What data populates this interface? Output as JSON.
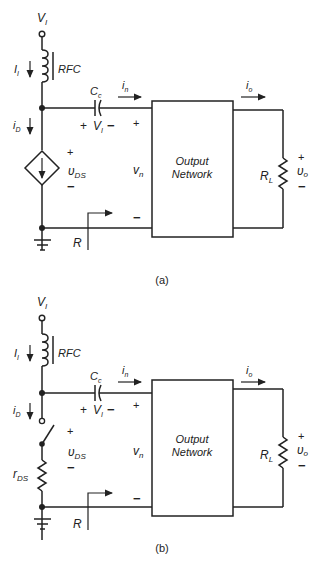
{
  "figure": {
    "panels": [
      {
        "id": "a",
        "caption": "(a)",
        "labels": {
          "supply": "V",
          "supply_sub": "I",
          "supply_current": "I",
          "supply_current_sub": "I",
          "choke": "RFC",
          "coupling_cap": "C",
          "coupling_cap_sub": "c",
          "input_current": "i",
          "input_current_sub": "n",
          "drain_current": "i",
          "drain_current_sub": "D",
          "cap_voltage_plus": "+",
          "cap_voltage": "V",
          "cap_voltage_sub": "I",
          "cap_voltage_minus": "−",
          "device_voltage_plus": "+",
          "device_voltage": "υ",
          "device_voltage_sub": "DS",
          "device_voltage_minus": "−",
          "input_voltage_plus": "+",
          "input_voltage": "v",
          "input_voltage_sub": "n",
          "input_voltage_minus": "−",
          "input_resistance": "R",
          "network_line1": "Output",
          "network_line2": "Network",
          "output_current": "i",
          "output_current_sub": "o",
          "load": "R",
          "load_sub": "L",
          "output_voltage_plus": "+",
          "output_voltage": "υ",
          "output_voltage_sub": "o",
          "output_voltage_minus": "−"
        },
        "device": "dependent-current-source"
      },
      {
        "id": "b",
        "caption": "(b)",
        "labels": {
          "supply": "V",
          "supply_sub": "I",
          "supply_current": "I",
          "supply_current_sub": "I",
          "choke": "RFC",
          "coupling_cap": "C",
          "coupling_cap_sub": "c",
          "input_current": "i",
          "input_current_sub": "n",
          "drain_current": "i",
          "drain_current_sub": "D",
          "cap_voltage_plus": "+",
          "cap_voltage": "V",
          "cap_voltage_sub": "I",
          "cap_voltage_minus": "−",
          "device_voltage_plus": "+",
          "device_voltage": "υ",
          "device_voltage_sub": "DS",
          "device_voltage_minus": "−",
          "switch_resistance": "r",
          "switch_resistance_sub": "DS",
          "input_voltage": "v",
          "input_voltage_sub": "n",
          "input_voltage_minus": "−",
          "input_resistance": "R",
          "network_line1": "Output",
          "network_line2": "Network",
          "output_current": "i",
          "output_current_sub": "o",
          "load": "R",
          "load_sub": "L",
          "output_voltage_plus": "+",
          "output_voltage": "υ",
          "output_voltage_sub": "o",
          "output_voltage_minus": "−"
        },
        "device": "switch-with-resistor"
      }
    ]
  }
}
